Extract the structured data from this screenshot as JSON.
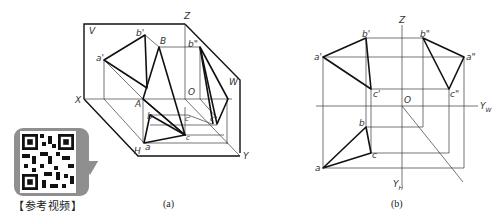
{
  "figure_a": {
    "caption": "(a)",
    "labels": {
      "V": "V",
      "W": "W",
      "H": "H",
      "X": "X",
      "Y": "Y",
      "Z": "Z",
      "O": "O",
      "A": "A",
      "B": "B",
      "a_prime": "a'",
      "b_prime": "b'",
      "b_double_prime": "b\"",
      "c_prime": "c'",
      "c_double_prime": "c\"",
      "a": "a",
      "b": "b",
      "c": "c"
    }
  },
  "figure_b": {
    "caption": "(b)",
    "labels": {
      "Z": "Z",
      "O": "O",
      "Y_W": "Y",
      "Y_W_sub": "W",
      "Y_H": "Y",
      "Y_H_sub": "H",
      "a_prime": "a'",
      "b_prime": "b'",
      "c_prime": "c'",
      "a_double_prime": "a\"",
      "b_double_prime": "b\"",
      "c_double_prime": "c\"",
      "a": "a",
      "b": "b",
      "c": "c"
    }
  },
  "qr": {
    "label": "【参考视频】",
    "icon": "qr-code-icon"
  }
}
